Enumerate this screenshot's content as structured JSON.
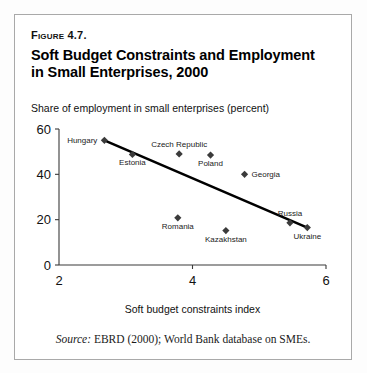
{
  "figure": {
    "number_label": "Figure 4.7.",
    "title": "Soft Budget Constraints and Employment in Small Enterprises, 2000",
    "source_label": "Source:",
    "source_text": " EBRD (2000); World Bank database on SMEs."
  },
  "chart_data": {
    "type": "scatter",
    "title": "Soft Budget Constraints and Employment in Small Enterprises, 2000",
    "subtitle": "Share of employment in small enterprises (percent)",
    "xlabel": "Soft budget constraints index",
    "ylabel": "Share of employment in small enterprises (percent)",
    "xlim": [
      2,
      6
    ],
    "ylim": [
      0,
      60
    ],
    "xticks": [
      2,
      4,
      6
    ],
    "xtick_labels": [
      "2",
      "4",
      "6"
    ],
    "yticks": [
      0,
      20,
      40,
      60
    ],
    "ytick_labels": [
      "0",
      "20",
      "40",
      "60"
    ],
    "grid": false,
    "legend": "none",
    "marker_color": "#3b3b3b",
    "line_color": "#000000",
    "points": [
      {
        "label": "Hungary",
        "x": 2.68,
        "y": 55.0,
        "label_pos": "left"
      },
      {
        "label": "Estonia",
        "x": 3.1,
        "y": 48.8,
        "label_pos": "below"
      },
      {
        "label": "Czech Republic",
        "x": 3.8,
        "y": 49.0,
        "label_pos": "above"
      },
      {
        "label": "Poland",
        "x": 4.27,
        "y": 48.5,
        "label_pos": "below"
      },
      {
        "label": "Georgia",
        "x": 4.78,
        "y": 40.0,
        "label_pos": "right"
      },
      {
        "label": "Romania",
        "x": 3.78,
        "y": 20.8,
        "label_pos": "below"
      },
      {
        "label": "Kazakhstan",
        "x": 4.5,
        "y": 15.2,
        "label_pos": "below"
      },
      {
        "label": "Russia",
        "x": 5.46,
        "y": 18.6,
        "label_pos": "above"
      },
      {
        "label": "Ukraine",
        "x": 5.72,
        "y": 16.5,
        "label_pos": "below"
      }
    ],
    "trendline": {
      "x0": 2.68,
      "y0": 55.0,
      "x1": 5.72,
      "y1": 16.5
    }
  }
}
